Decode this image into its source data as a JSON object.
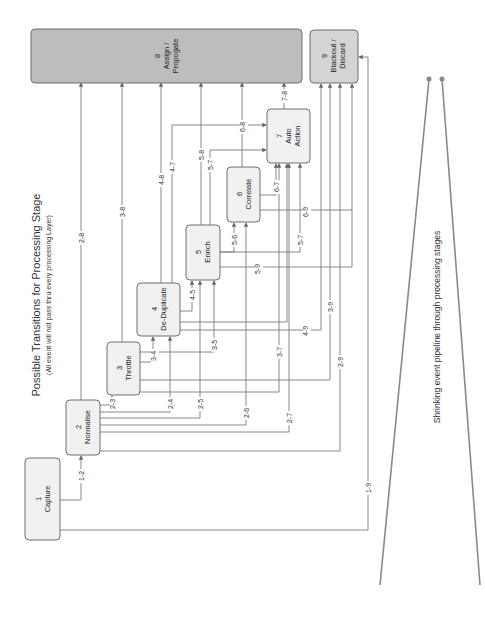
{
  "title": "Possible Transitions for Processing Stage",
  "subtitle": "(All event will not pass thru every processing Layer)",
  "caption": "Shrinking event pipeline through processing stages",
  "stages": [
    {
      "num": "1",
      "name": "Capture"
    },
    {
      "num": "2",
      "name": "Normalise"
    },
    {
      "num": "3",
      "name": "Throttle"
    },
    {
      "num": "4",
      "name": "De-Duplicate"
    },
    {
      "num": "5",
      "name": "Enrich"
    },
    {
      "num": "6",
      "name": "Correlate"
    },
    {
      "num": "7",
      "name": "Auto",
      "name2": "Action"
    },
    {
      "num": "8",
      "name": "Assign /",
      "name2": "Propogate"
    },
    {
      "num": "9",
      "name": "Blackout /",
      "name2": "Discard"
    }
  ],
  "transitions": {
    "t12": "1-2",
    "t19": "1-9",
    "t23": "2-3",
    "t24": "2-4",
    "t25": "2-5",
    "t26": "2-6",
    "t27": "2-7",
    "t28": "2-8",
    "t29": "2-9",
    "t34": "3-4",
    "t35": "3-5",
    "t37": "3-7",
    "t38": "3-8",
    "t39": "3-9",
    "t45": "4-5",
    "t47": "4-7",
    "t48": "4-8",
    "t49": "4-9",
    "t56": "5-6",
    "t57a": "5-7",
    "t57b": "5-7",
    "t58": "5-8",
    "t59": "5-9",
    "t67": "6-7",
    "t68": "6-8",
    "t69": "6-9",
    "t78": "7-8"
  },
  "colors": {
    "box_light": "#f1f1f1",
    "box_dark": "#bdbdbd",
    "line": "#7a7a7a"
  }
}
